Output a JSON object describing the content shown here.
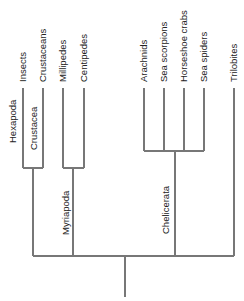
{
  "diagram": {
    "type": "cladogram",
    "colors": {
      "line": "#777777",
      "text": "#222222",
      "background": "#ffffff"
    },
    "leaves": [
      {
        "id": "insects",
        "label": "Insects",
        "x": 23
      },
      {
        "id": "crustaceans",
        "label": "Crustaceans",
        "x": 43
      },
      {
        "id": "millipedes",
        "label": "Millipedes",
        "x": 63
      },
      {
        "id": "centipedes",
        "label": "Centipedes",
        "x": 84
      },
      {
        "id": "arachnids",
        "label": "Arachnids",
        "x": 144
      },
      {
        "id": "sea-scorpions",
        "label": "Sea scorpions",
        "x": 164
      },
      {
        "id": "horseshoe-crabs",
        "label": "Horseshoe crabs",
        "x": 184
      },
      {
        "id": "sea-spiders",
        "label": "Sea spiders",
        "x": 204
      },
      {
        "id": "trilobites",
        "label": "Trilobites",
        "x": 234
      }
    ],
    "clades": [
      {
        "id": "hexapoda",
        "label": "Hexapoda"
      },
      {
        "id": "crustacea",
        "label": "Crustacea"
      },
      {
        "id": "myriapoda",
        "label": "Myriapoda"
      },
      {
        "id": "chelicerata",
        "label": "Chelicerata"
      }
    ]
  }
}
